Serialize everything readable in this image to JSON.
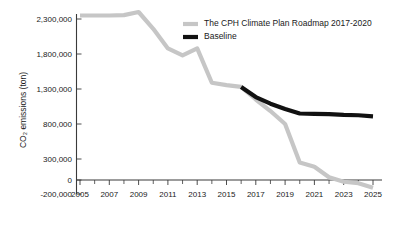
{
  "chart_data": {
    "type": "line",
    "title": "",
    "xlabel": "",
    "ylabel": "CO₂ emissions (ton)",
    "xlim": [
      2005,
      2025
    ],
    "ylim": [
      -200000,
      2500000
    ],
    "grid": false,
    "legend_position": "top-right",
    "x_tick_labels": [
      "2005",
      "2007",
      "2009",
      "2011",
      "2013",
      "2015",
      "2017",
      "2019",
      "2021",
      "2023",
      "2025"
    ],
    "x_tick_values": [
      2005,
      2007,
      2009,
      2011,
      2013,
      2015,
      2017,
      2019,
      2021,
      2023,
      2025
    ],
    "x_minor_ticks": [
      2006,
      2008,
      2010,
      2012,
      2014,
      2016,
      2018,
      2020,
      2022,
      2024
    ],
    "y_tick_labels": [
      "2,300,000",
      "1,800,000",
      "1,300,000",
      "800,000",
      "300,000",
      "0",
      "-200,000"
    ],
    "y_tick_values": [
      2300000,
      1800000,
      1300000,
      800000,
      300000,
      0,
      -200000
    ],
    "x": [
      2005,
      2006,
      2007,
      2008,
      2009,
      2010,
      2011,
      2012,
      2013,
      2014,
      2015,
      2016,
      2017,
      2018,
      2019,
      2020,
      2021,
      2022,
      2023,
      2024,
      2025
    ],
    "series": [
      {
        "name": "The CPH Climate Plan Roadmap 2017-2020",
        "color": "#c6c6c6",
        "width": 4.2,
        "values": [
          2350000,
          2350000,
          2350000,
          2355000,
          2400000,
          2160000,
          1880000,
          1780000,
          1880000,
          1390000,
          1355000,
          1330000,
          1150000,
          985000,
          800000,
          250000,
          190000,
          40000,
          -25000,
          -45000,
          -110000
        ]
      },
      {
        "name": "Baseline",
        "color": "#111111",
        "width": 4.2,
        "values": [
          null,
          null,
          null,
          null,
          null,
          null,
          null,
          null,
          null,
          null,
          null,
          1330000,
          1185000,
          1090000,
          1015000,
          950000,
          945000,
          940000,
          930000,
          925000,
          910000
        ]
      }
    ],
    "legend": [
      {
        "label": "The CPH Climate Plan Roadmap 2017-2020",
        "color": "#c6c6c6"
      },
      {
        "label": "Baseline",
        "color": "#111111"
      }
    ]
  },
  "axis": {
    "y_title": "CO₂ emissions (ton)"
  },
  "colors": {
    "roadmap": "#c6c6c6",
    "baseline": "#111111",
    "axis": "#3a3a3a",
    "text": "#1a1a1a",
    "background": "#ffffff"
  }
}
